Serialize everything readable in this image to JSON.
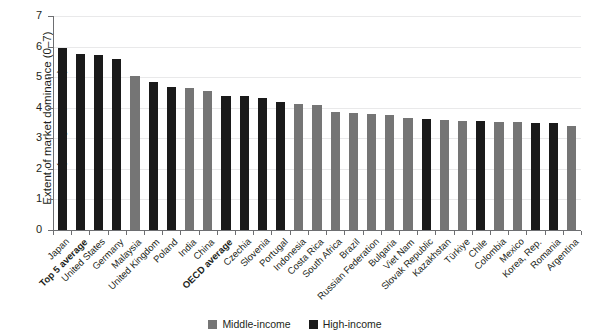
{
  "chart_data": {
    "type": "bar",
    "title": "",
    "subtitle": "",
    "xlabel": "",
    "ylabel": "Extent of market dominance (0–7)\n(survey responses)",
    "ylabel_line1": "Extent of market dominance (0–7)",
    "ylabel_line2": "(survey responses)",
    "ylim": [
      0,
      7
    ],
    "yticks": [
      0,
      1,
      2,
      3,
      4,
      5,
      6,
      7
    ],
    "ytick_labels": [
      "0",
      "1",
      "2",
      "3",
      "4",
      "5",
      "6",
      "7"
    ],
    "grid": true,
    "grid_axis": "y",
    "legend_position": "bottom-center",
    "categories": [
      "Japan",
      "Top 5 average",
      "United States",
      "Germany",
      "Malaysia",
      "United Kingdom",
      "Poland",
      "India",
      "China",
      "OECD average",
      "Czechia",
      "Slovenia",
      "Portugal",
      "Indonesia",
      "Costa Rica",
      "South Africa",
      "Brazil",
      "Russian Federation",
      "Bulgaria",
      "Viet Nam",
      "Slovak Republic",
      "Kazakhstan",
      "Türkiye",
      "Chile",
      "Colombia",
      "Mexico",
      "Korea, Rep.",
      "Romania",
      "Argentina"
    ],
    "values": [
      5.95,
      5.75,
      5.72,
      5.58,
      5.05,
      4.85,
      4.67,
      4.66,
      4.55,
      4.4,
      4.38,
      4.33,
      4.18,
      4.13,
      4.1,
      3.85,
      3.83,
      3.8,
      3.75,
      3.65,
      3.62,
      3.6,
      3.55,
      3.55,
      3.53,
      3.52,
      3.5,
      3.5,
      3.4
    ],
    "bold_categories": [
      "Top 5 average",
      "OECD average"
    ],
    "group_by_category": [
      "High-income",
      "High-income",
      "High-income",
      "High-income",
      "Middle-income",
      "High-income",
      "High-income",
      "Middle-income",
      "Middle-income",
      "High-income",
      "High-income",
      "High-income",
      "High-income",
      "Middle-income",
      "Middle-income",
      "Middle-income",
      "Middle-income",
      "Middle-income",
      "Middle-income",
      "Middle-income",
      "High-income",
      "Middle-income",
      "Middle-income",
      "High-income",
      "Middle-income",
      "Middle-income",
      "High-income",
      "High-income",
      "Middle-income"
    ],
    "series": [
      {
        "name": "Middle-income",
        "color": "#757575",
        "members": [
          "Malaysia",
          "India",
          "China",
          "Indonesia",
          "Costa Rica",
          "South Africa",
          "Brazil",
          "Russian Federation",
          "Bulgaria",
          "Viet Nam",
          "Kazakhstan",
          "Türkiye",
          "Colombia",
          "Mexico",
          "Argentina"
        ]
      },
      {
        "name": "High-income",
        "color": "#1a1a1a",
        "members": [
          "Japan",
          "Top 5 average",
          "United States",
          "Germany",
          "United Kingdom",
          "Poland",
          "OECD average",
          "Czechia",
          "Slovenia",
          "Portugal",
          "Slovak Republic",
          "Chile",
          "Korea, Rep.",
          "Romania"
        ]
      }
    ]
  },
  "legend": {
    "items": [
      {
        "label": "Middle-income",
        "color": "#757575"
      },
      {
        "label": "High-income",
        "color": "#1a1a1a"
      }
    ]
  },
  "colors": {
    "middle_income": "#757575",
    "high_income": "#1a1a1a",
    "axis": "#6d6e71",
    "grid": "#e9e9ea",
    "text": "#231f20",
    "background": "#ffffff"
  }
}
